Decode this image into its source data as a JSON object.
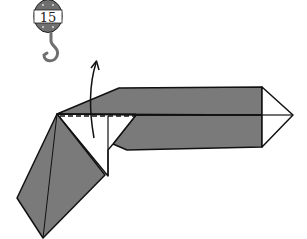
{
  "diagram": {
    "type": "origami-fold-step",
    "step_badge": {
      "number": "15",
      "icon": "crane-hook-icon"
    },
    "fold_arrow": {
      "direction": "up",
      "meaning": "fold flap upward along dashed valley line"
    },
    "fold_line": {
      "style": "dashed",
      "type": "valley-fold"
    },
    "colors": {
      "paper_colored": "#7a7a7a",
      "paper_white": "#ffffff",
      "outline": "#111111",
      "badge_fill": "#6f6f6f"
    }
  }
}
